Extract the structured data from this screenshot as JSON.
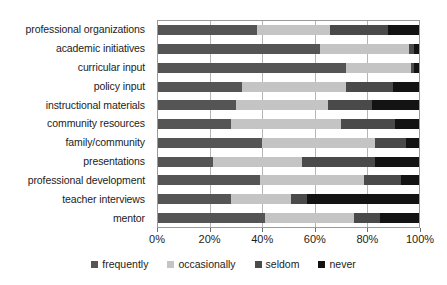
{
  "chart_data": {
    "type": "bar",
    "subtype": "horizontal-stacked-100-percent",
    "title": "",
    "xlabel": "",
    "ylabel": "",
    "xlim": [
      0,
      100
    ],
    "xtick_labels": [
      "0%",
      "20%",
      "40%",
      "60%",
      "80%",
      "100%"
    ],
    "xtick_values": [
      0,
      20,
      40,
      60,
      80,
      100
    ],
    "grid": true,
    "legend_position": "bottom",
    "categories": [
      "professional organizations",
      "academic initiatives",
      "curricular input",
      "policy input",
      "instructional materials",
      "community resources",
      "family/community",
      "presentations",
      "professional development",
      "teacher interviews",
      "mentor"
    ],
    "series": [
      {
        "name": "frequently",
        "color": "#555555",
        "values": [
          38,
          62,
          72,
          32,
          30,
          28,
          40,
          21,
          39,
          28,
          41
        ]
      },
      {
        "name": "occasionally",
        "color": "#c4c4c4",
        "values": [
          28,
          34,
          25,
          40,
          35,
          42,
          43,
          34,
          40,
          23,
          34
        ]
      },
      {
        "name": "seldom",
        "color": "#4a4a4a",
        "values": [
          22,
          2,
          1,
          18,
          17,
          21,
          12,
          28,
          14,
          6,
          10
        ]
      },
      {
        "name": "never",
        "color": "#131313",
        "values": [
          12,
          2,
          2,
          10,
          18,
          9,
          5,
          17,
          7,
          43,
          15
        ]
      }
    ]
  },
  "legend": {
    "items": [
      {
        "label": "frequently",
        "color": "#555555"
      },
      {
        "label": "occasionally",
        "color": "#c4c4c4"
      },
      {
        "label": "seldom",
        "color": "#4a4a4a"
      },
      {
        "label": "never",
        "color": "#131313"
      }
    ]
  }
}
